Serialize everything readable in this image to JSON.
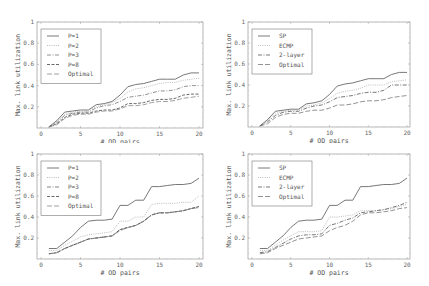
{
  "chart_data": [
    {
      "id": "top-left",
      "type": "line",
      "title": "",
      "xlabel": "# OD pairs",
      "ylabel": "Max. link utilization",
      "xlim": [
        0,
        20
      ],
      "ylim": [
        0,
        1
      ],
      "xticks": [
        0,
        5,
        10,
        15,
        20
      ],
      "yticks": [
        0.2,
        0.4,
        0.6,
        0.8,
        1
      ],
      "ytick_labels": [
        "0.2",
        "0.4",
        "0.6",
        "0.8",
        "1"
      ],
      "legend_position": "upper left",
      "x": [
        1,
        2,
        3,
        4,
        5,
        6,
        7,
        8,
        9,
        10,
        11,
        12,
        13,
        14,
        15,
        16,
        17,
        18,
        19,
        20
      ],
      "series": [
        {
          "name": "P=1",
          "style": "solid",
          "color": "#555555",
          "values": [
            0.01,
            0.07,
            0.15,
            0.16,
            0.17,
            0.17,
            0.22,
            0.23,
            0.25,
            0.31,
            0.39,
            0.41,
            0.42,
            0.44,
            0.46,
            0.46,
            0.46,
            0.5,
            0.52,
            0.52
          ]
        },
        {
          "name": "P=2",
          "style": "dotted",
          "color": "#aaaaaa",
          "values": [
            0.01,
            0.06,
            0.13,
            0.15,
            0.16,
            0.16,
            0.2,
            0.22,
            0.24,
            0.28,
            0.34,
            0.37,
            0.38,
            0.4,
            0.42,
            0.43,
            0.43,
            0.45,
            0.46,
            0.47
          ]
        },
        {
          "name": "P=3",
          "style": "dashdot",
          "color": "#777777",
          "values": [
            0.01,
            0.05,
            0.12,
            0.14,
            0.15,
            0.15,
            0.19,
            0.21,
            0.22,
            0.25,
            0.29,
            0.3,
            0.31,
            0.33,
            0.35,
            0.35,
            0.36,
            0.39,
            0.4,
            0.4
          ]
        },
        {
          "name": "P=8",
          "style": "dashed",
          "color": "#444444",
          "values": [
            0.01,
            0.04,
            0.1,
            0.13,
            0.14,
            0.14,
            0.16,
            0.17,
            0.17,
            0.19,
            0.23,
            0.23,
            0.24,
            0.26,
            0.27,
            0.27,
            0.28,
            0.31,
            0.32,
            0.32
          ]
        },
        {
          "name": "Optimal",
          "style": "longdash",
          "color": "#888888",
          "values": [
            0.01,
            0.03,
            0.09,
            0.12,
            0.13,
            0.13,
            0.15,
            0.16,
            0.16,
            0.18,
            0.21,
            0.21,
            0.22,
            0.24,
            0.25,
            0.25,
            0.26,
            0.28,
            0.29,
            0.3
          ]
        }
      ]
    },
    {
      "id": "top-right",
      "type": "line",
      "title": "",
      "xlabel": "# OD pairs",
      "ylabel": "Max. link utilization",
      "xlim": [
        0,
        20
      ],
      "ylim": [
        0,
        1
      ],
      "xticks": [
        0,
        5,
        10,
        15,
        20
      ],
      "yticks": [
        0.2,
        0.4,
        0.6,
        0.8,
        1
      ],
      "ytick_labels": [
        "0.2",
        "0.4",
        "0.6",
        "0.8",
        "1"
      ],
      "legend_position": "upper left",
      "x": [
        1,
        2,
        3,
        4,
        5,
        6,
        7,
        8,
        9,
        10,
        11,
        12,
        13,
        14,
        15,
        16,
        17,
        18,
        19,
        20
      ],
      "series": [
        {
          "name": "SP",
          "style": "solid",
          "color": "#555555",
          "values": [
            0.01,
            0.07,
            0.15,
            0.16,
            0.17,
            0.17,
            0.22,
            0.23,
            0.25,
            0.31,
            0.39,
            0.41,
            0.42,
            0.44,
            0.46,
            0.46,
            0.46,
            0.5,
            0.52,
            0.52
          ]
        },
        {
          "name": "ECMP",
          "style": "dotted",
          "color": "#aaaaaa",
          "values": [
            0.01,
            0.06,
            0.13,
            0.15,
            0.16,
            0.16,
            0.2,
            0.21,
            0.23,
            0.27,
            0.32,
            0.34,
            0.35,
            0.37,
            0.4,
            0.4,
            0.4,
            0.43,
            0.44,
            0.45
          ]
        },
        {
          "name": "2-layer",
          "style": "dashdot",
          "color": "#555555",
          "values": [
            0.01,
            0.05,
            0.11,
            0.14,
            0.15,
            0.15,
            0.18,
            0.2,
            0.21,
            0.24,
            0.28,
            0.29,
            0.3,
            0.32,
            0.33,
            0.33,
            0.35,
            0.4,
            0.4,
            0.4
          ]
        },
        {
          "name": "Optimal",
          "style": "longdash",
          "color": "#777777",
          "values": [
            0.01,
            0.03,
            0.09,
            0.12,
            0.13,
            0.13,
            0.15,
            0.16,
            0.16,
            0.18,
            0.21,
            0.21,
            0.22,
            0.24,
            0.25,
            0.25,
            0.26,
            0.28,
            0.29,
            0.3
          ]
        }
      ]
    },
    {
      "id": "bottom-left",
      "type": "line",
      "title": "",
      "xlabel": "# OD pairs",
      "ylabel": "Max. link utilization",
      "xlim": [
        0,
        20
      ],
      "ylim": [
        0,
        1
      ],
      "xticks": [
        0,
        5,
        10,
        15,
        20
      ],
      "yticks": [
        0.2,
        0.4,
        0.6,
        0.8,
        1
      ],
      "ytick_labels": [
        "0.2",
        "0.4",
        "0.6",
        "0.8",
        "1"
      ],
      "legend_position": "upper left",
      "x": [
        1,
        2,
        3,
        4,
        5,
        6,
        7,
        8,
        9,
        10,
        11,
        12,
        13,
        14,
        15,
        16,
        17,
        18,
        19,
        20
      ],
      "series": [
        {
          "name": "P=1",
          "style": "solid",
          "color": "#555555",
          "values": [
            0.1,
            0.1,
            0.16,
            0.22,
            0.3,
            0.36,
            0.37,
            0.37,
            0.38,
            0.51,
            0.51,
            0.56,
            0.56,
            0.69,
            0.69,
            0.7,
            0.71,
            0.71,
            0.72,
            0.77
          ]
        },
        {
          "name": "P=2",
          "style": "dotted",
          "color": "#aaaaaa",
          "values": [
            0.08,
            0.08,
            0.13,
            0.17,
            0.21,
            0.23,
            0.24,
            0.25,
            0.26,
            0.36,
            0.36,
            0.4,
            0.4,
            0.52,
            0.53,
            0.53,
            0.53,
            0.54,
            0.54,
            0.6
          ]
        },
        {
          "name": "P=3",
          "style": "dashdot",
          "color": "#666666",
          "values": [
            0.05,
            0.06,
            0.1,
            0.13,
            0.16,
            0.19,
            0.2,
            0.21,
            0.22,
            0.28,
            0.3,
            0.32,
            0.36,
            0.42,
            0.44,
            0.44,
            0.45,
            0.46,
            0.48,
            0.5
          ]
        },
        {
          "name": "P=8",
          "style": "dashed",
          "color": "#444444",
          "values": [
            0.05,
            0.06,
            0.1,
            0.13,
            0.16,
            0.19,
            0.2,
            0.21,
            0.22,
            0.28,
            0.3,
            0.32,
            0.36,
            0.42,
            0.44,
            0.44,
            0.45,
            0.46,
            0.48,
            0.5
          ]
        },
        {
          "name": "Optimal",
          "style": "longdash",
          "color": "#888888",
          "values": [
            0.05,
            0.06,
            0.1,
            0.13,
            0.16,
            0.19,
            0.2,
            0.21,
            0.22,
            0.27,
            0.3,
            0.32,
            0.36,
            0.42,
            0.44,
            0.44,
            0.45,
            0.46,
            0.48,
            0.49
          ]
        }
      ]
    },
    {
      "id": "bottom-right",
      "type": "line",
      "title": "",
      "xlabel": "# OD pairs",
      "ylabel": "Max. link utilization",
      "xlim": [
        0,
        20
      ],
      "ylim": [
        0,
        1
      ],
      "xticks": [
        0,
        5,
        10,
        15,
        20
      ],
      "yticks": [
        0.2,
        0.4,
        0.6,
        0.8,
        1
      ],
      "ytick_labels": [
        "0.2",
        "0.4",
        "0.6",
        "0.8",
        "1"
      ],
      "legend_position": "upper left",
      "x": [
        1,
        2,
        3,
        4,
        5,
        6,
        7,
        8,
        9,
        10,
        11,
        12,
        13,
        14,
        15,
        16,
        17,
        18,
        19,
        20
      ],
      "series": [
        {
          "name": "SP",
          "style": "solid",
          "color": "#555555",
          "values": [
            0.1,
            0.1,
            0.16,
            0.22,
            0.3,
            0.36,
            0.37,
            0.37,
            0.38,
            0.51,
            0.51,
            0.56,
            0.56,
            0.69,
            0.69,
            0.7,
            0.71,
            0.71,
            0.72,
            0.77
          ]
        },
        {
          "name": "ECMP",
          "style": "dotted",
          "color": "#aaaaaa",
          "values": [
            0.08,
            0.08,
            0.13,
            0.18,
            0.22,
            0.26,
            0.26,
            0.26,
            0.27,
            0.4,
            0.4,
            0.41,
            0.42,
            0.46,
            0.46,
            0.46,
            0.47,
            0.48,
            0.5,
            0.52
          ]
        },
        {
          "name": "2-layer",
          "style": "dashdot",
          "color": "#555555",
          "values": [
            0.06,
            0.07,
            0.11,
            0.15,
            0.19,
            0.22,
            0.23,
            0.23,
            0.24,
            0.32,
            0.34,
            0.37,
            0.39,
            0.44,
            0.45,
            0.46,
            0.47,
            0.49,
            0.51,
            0.54
          ]
        },
        {
          "name": "Optimal",
          "style": "longdash",
          "color": "#777777",
          "values": [
            0.05,
            0.06,
            0.1,
            0.13,
            0.16,
            0.19,
            0.2,
            0.21,
            0.22,
            0.27,
            0.3,
            0.32,
            0.36,
            0.42,
            0.44,
            0.44,
            0.45,
            0.46,
            0.48,
            0.49
          ]
        }
      ]
    }
  ],
  "panels": [
    {
      "legend": [
        "P=1",
        "P=2",
        "P=3",
        "P=8",
        "Optimal"
      ]
    },
    {
      "legend": [
        "SP",
        "ECMP",
        "2-layer",
        "Optimal"
      ]
    },
    {
      "legend": [
        "P=1",
        "P=2",
        "P=3",
        "P=8",
        "Optimal"
      ]
    },
    {
      "legend": [
        "SP",
        "ECMP",
        "2-layer",
        "Optimal"
      ]
    }
  ]
}
